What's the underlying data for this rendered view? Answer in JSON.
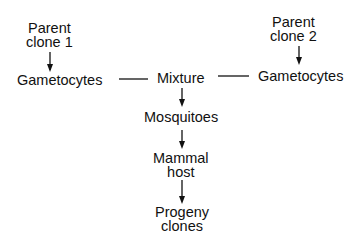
{
  "nodes": {
    "parent1": [
      "Parent",
      "clone 1"
    ],
    "parent2": [
      "Parent",
      "clone 2"
    ],
    "gam1": "Gametocytes",
    "gam2": "Gametocytes",
    "mixture": "Mixture",
    "mosquitoes": "Mosquitoes",
    "mammal": [
      "Mammal",
      "host"
    ],
    "progeny": [
      "Progeny",
      "clones"
    ]
  }
}
